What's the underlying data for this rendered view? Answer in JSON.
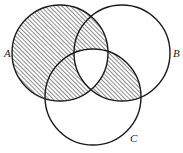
{
  "figure": {
    "kind": "venn-diagram",
    "set_count": 3,
    "background_color": "#ffffff",
    "stroke_color": "#1a1a1a",
    "hatch_color": "#1a1a1a",
    "hatch_angle_degrees": 45,
    "hatch_spacing_px": 3,
    "labels": {
      "a": "A",
      "b": "B",
      "c": "C"
    },
    "label_positions": {
      "a": {
        "x": 4,
        "y": 57
      },
      "b": {
        "x": 173,
        "y": 57
      },
      "c": {
        "x": 130,
        "y": 142
      }
    },
    "circles": [
      {
        "name": "A",
        "cx": 60,
        "cy": 53,
        "r": 48,
        "shaded": true
      },
      {
        "name": "B",
        "cx": 122,
        "cy": 53,
        "r": 48,
        "shaded": false
      },
      {
        "name": "C",
        "cx": 93,
        "cy": 97,
        "r": 48,
        "shaded": false
      }
    ],
    "shaded_regions": [
      "A-only",
      "A-intersect-B-not-C",
      "A-intersect-C-not-B",
      "B-intersect-C-not-A"
    ],
    "unshaded_regions": [
      "A-intersect-B-intersect-C",
      "B-only",
      "C-only",
      "outside-all"
    ],
    "shaded_set_expression": "(A ∪ (B ∩ C)) \\ (A ∩ B ∩ C)"
  }
}
